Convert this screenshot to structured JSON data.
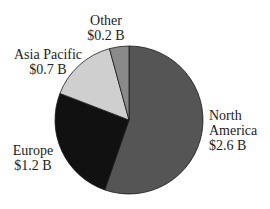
{
  "chart_data": {
    "type": "pie",
    "title": "",
    "unit": "$ B",
    "start_angle_deg": 0,
    "direction": "clockwise",
    "slices": [
      {
        "name": "North America",
        "label_line1": "North",
        "label_line2": "America",
        "value": 2.6,
        "value_label": "$2.6 B",
        "color": "#555555"
      },
      {
        "name": "Europe",
        "label_line1": "Europe",
        "value": 1.2,
        "value_label": "$1.2 B",
        "color": "#111111"
      },
      {
        "name": "Asia Pacific",
        "label_line1": "Asia Pacific",
        "value": 0.7,
        "value_label": "$0.7 B",
        "color": "#cfcfcf"
      },
      {
        "name": "Other",
        "label_line1": "Other",
        "value": 0.2,
        "value_label": "$0.2 B",
        "color": "#8a8a8a"
      }
    ],
    "categories": [
      "North America",
      "Europe",
      "Asia Pacific",
      "Other"
    ],
    "values": [
      2.6,
      1.2,
      0.7,
      0.2
    ],
    "legend": "none (direct labels)"
  },
  "geometry": {
    "cx": 129,
    "cy": 120,
    "r": 74
  }
}
